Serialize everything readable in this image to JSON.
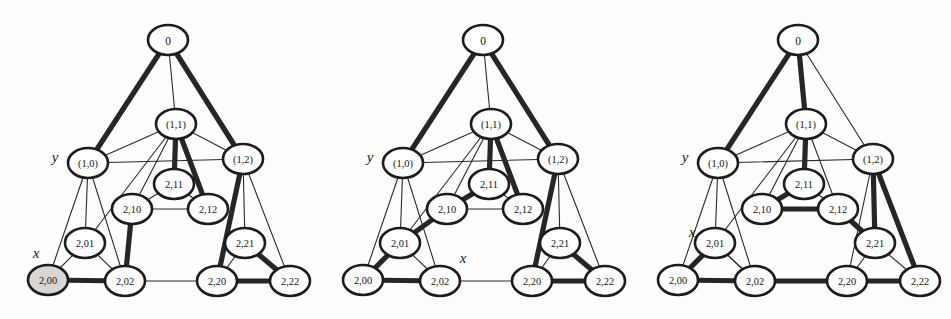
{
  "figure": {
    "type": "graph-diagram-triptych",
    "background_color": "#fdfdfb",
    "node_fill": "#ffffff",
    "node_shaded_fill": "#d8d6d2",
    "stroke_color": "#1c1c1c",
    "thick_edge_color": "#262626",
    "panel_count": 3
  },
  "node_layout": [
    {
      "id": "root",
      "label": "0",
      "x": 168,
      "y": 40
    },
    {
      "id": "n11",
      "label": "(1,1)",
      "x": 176,
      "y": 124
    },
    {
      "id": "n10",
      "label": "(1,0)",
      "x": 88,
      "y": 163
    },
    {
      "id": "n12",
      "label": "(1,2)",
      "x": 243,
      "y": 159
    },
    {
      "id": "n211",
      "label": "2,11",
      "x": 174,
      "y": 184
    },
    {
      "id": "n210",
      "label": "2,10",
      "x": 132,
      "y": 209
    },
    {
      "id": "n212",
      "label": "2,12",
      "x": 208,
      "y": 209
    },
    {
      "id": "n201",
      "label": "2,01",
      "x": 85,
      "y": 243
    },
    {
      "id": "n221",
      "label": "2,21",
      "x": 245,
      "y": 243
    },
    {
      "id": "n200",
      "label": "2,00",
      "x": 48,
      "y": 280
    },
    {
      "id": "n202",
      "label": "2,02",
      "x": 125,
      "y": 281
    },
    {
      "id": "n220",
      "label": "2,20",
      "x": 217,
      "y": 281
    },
    {
      "id": "n222",
      "label": "2,22",
      "x": 290,
      "y": 281
    }
  ],
  "panels": [
    {
      "name": "panel-1",
      "offset_x": 0,
      "axis_labels": [
        {
          "text": "y",
          "x": 55,
          "y": 157
        },
        {
          "text": "x",
          "x": 36,
          "y": 253
        }
      ],
      "shaded_nodes": [
        "n200"
      ],
      "thin_edges": [
        [
          "root",
          "n11"
        ],
        [
          "n11",
          "n10"
        ],
        [
          "n11",
          "n12"
        ],
        [
          "n10",
          "n12"
        ],
        [
          "n11",
          "n210"
        ],
        [
          "n11",
          "n201"
        ],
        [
          "n10",
          "n201"
        ],
        [
          "n10",
          "n200"
        ],
        [
          "n10",
          "n202"
        ],
        [
          "n12",
          "n221"
        ],
        [
          "n12",
          "n222"
        ],
        [
          "n12",
          "n220"
        ],
        [
          "n211",
          "n210"
        ],
        [
          "n211",
          "n212"
        ],
        [
          "n210",
          "n212"
        ],
        [
          "n201",
          "n200"
        ],
        [
          "n201",
          "n202"
        ],
        [
          "n221",
          "n220"
        ],
        [
          "n221",
          "n222"
        ],
        [
          "n202",
          "n220"
        ]
      ],
      "thick_edges": [
        [
          "root",
          "n10"
        ],
        [
          "root",
          "n12"
        ],
        [
          "n11",
          "n211"
        ],
        [
          "n11",
          "n212"
        ],
        [
          "n12",
          "n220"
        ],
        [
          "n210",
          "n202"
        ],
        [
          "n200",
          "n202"
        ],
        [
          "n221",
          "n222"
        ],
        [
          "n220",
          "n222"
        ]
      ]
    },
    {
      "name": "panel-2",
      "offset_x": 315,
      "axis_labels": [
        {
          "text": "y",
          "x": 55,
          "y": 157
        },
        {
          "text": "x",
          "x": 148,
          "y": 258
        }
      ],
      "shaded_nodes": [],
      "thin_edges": [
        [
          "root",
          "n11"
        ],
        [
          "n11",
          "n10"
        ],
        [
          "n11",
          "n12"
        ],
        [
          "n10",
          "n12"
        ],
        [
          "n11",
          "n210"
        ],
        [
          "n11",
          "n201"
        ],
        [
          "n10",
          "n201"
        ],
        [
          "n10",
          "n200"
        ],
        [
          "n10",
          "n202"
        ],
        [
          "n12",
          "n221"
        ],
        [
          "n12",
          "n222"
        ],
        [
          "n12",
          "n220"
        ],
        [
          "n211",
          "n212"
        ],
        [
          "n210",
          "n212"
        ],
        [
          "n201",
          "n202"
        ],
        [
          "n221",
          "n220"
        ],
        [
          "n221",
          "n222"
        ],
        [
          "n202",
          "n220"
        ]
      ],
      "thick_edges": [
        [
          "root",
          "n10"
        ],
        [
          "root",
          "n12"
        ],
        [
          "n11",
          "n211"
        ],
        [
          "n11",
          "n212"
        ],
        [
          "n211",
          "n210"
        ],
        [
          "n12",
          "n220"
        ],
        [
          "n210",
          "n201"
        ],
        [
          "n201",
          "n200"
        ],
        [
          "n200",
          "n202"
        ],
        [
          "n221",
          "n222"
        ],
        [
          "n220",
          "n222"
        ]
      ]
    },
    {
      "name": "panel-3",
      "offset_x": 630,
      "axis_labels": [
        {
          "text": "y",
          "x": 55,
          "y": 157
        },
        {
          "text": "x",
          "x": 62,
          "y": 232
        }
      ],
      "shaded_nodes": [],
      "thin_edges": [
        [
          "root",
          "n12"
        ],
        [
          "n11",
          "n10"
        ],
        [
          "n11",
          "n12"
        ],
        [
          "n10",
          "n12"
        ],
        [
          "n11",
          "n210"
        ],
        [
          "n11",
          "n212"
        ],
        [
          "n11",
          "n201"
        ],
        [
          "n10",
          "n201"
        ],
        [
          "n10",
          "n200"
        ],
        [
          "n10",
          "n202"
        ],
        [
          "n12",
          "n220"
        ],
        [
          "n211",
          "n212"
        ],
        [
          "n201",
          "n202"
        ],
        [
          "n221",
          "n220"
        ],
        [
          "n221",
          "n222"
        ],
        [
          "n202",
          "n201"
        ]
      ],
      "thick_edges": [
        [
          "root",
          "n10"
        ],
        [
          "root",
          "n11"
        ],
        [
          "n11",
          "n211"
        ],
        [
          "n211",
          "n210"
        ],
        [
          "n210",
          "n212"
        ],
        [
          "n212",
          "n221"
        ],
        [
          "n12",
          "n221"
        ],
        [
          "n12",
          "n222"
        ],
        [
          "n201",
          "n200"
        ],
        [
          "n200",
          "n202"
        ],
        [
          "n202",
          "n220"
        ],
        [
          "n220",
          "n222"
        ]
      ]
    }
  ]
}
